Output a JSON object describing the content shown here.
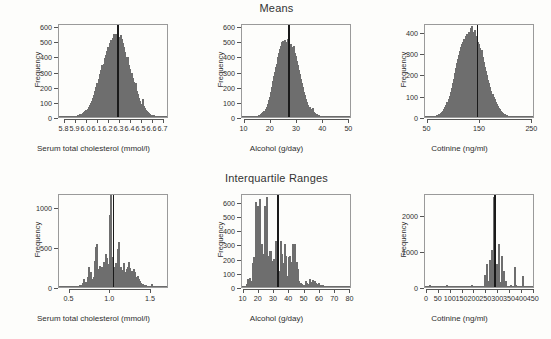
{
  "figure": {
    "background_color": "#fdfdfb",
    "bar_fill_color": "#b9b9b9",
    "bar_edge_color": "#6e6e6e",
    "reference_line_color": "#1a1a1a",
    "row_titles": [
      "Means",
      "Interquartile Ranges"
    ]
  },
  "chart_data": [
    {
      "id": "top-left",
      "type": "bar",
      "title": "",
      "xlabel": "Serum total cholesterol (mmol/l)",
      "ylabel": "Frequency",
      "xlim": [
        5.75,
        6.75
      ],
      "ylim": [
        0,
        620
      ],
      "xticks": [
        5.8,
        5.9,
        6.0,
        6.1,
        6.2,
        6.3,
        6.4,
        6.5,
        6.6,
        6.7
      ],
      "xticklabels": [
        "5.8",
        "5.9",
        "6.0",
        "6.1",
        "6.2",
        "6.3",
        "6.4",
        "6.5",
        "6.6",
        "6.7"
      ],
      "yticks": [
        0,
        100,
        200,
        300,
        400,
        500,
        600
      ],
      "yticklabels": [
        "0",
        "100",
        "200",
        "300",
        "400",
        "500",
        "600"
      ],
      "grid": false,
      "reference_line": 6.28,
      "bin_width": 0.01,
      "bin_starts": [
        5.82,
        5.83,
        5.84,
        5.85,
        5.86,
        5.87,
        5.88,
        5.89,
        5.9,
        5.91,
        5.92,
        5.93,
        5.94,
        5.95,
        5.96,
        5.97,
        5.98,
        5.99,
        6.0,
        6.01,
        6.02,
        6.03,
        6.04,
        6.05,
        6.06,
        6.07,
        6.08,
        6.09,
        6.1,
        6.11,
        6.12,
        6.13,
        6.14,
        6.15,
        6.16,
        6.17,
        6.18,
        6.19,
        6.2,
        6.21,
        6.22,
        6.23,
        6.24,
        6.25,
        6.26,
        6.27,
        6.28,
        6.29,
        6.3,
        6.31,
        6.32,
        6.33,
        6.34,
        6.35,
        6.36,
        6.37,
        6.38,
        6.39,
        6.4,
        6.41,
        6.42,
        6.43,
        6.44,
        6.45,
        6.46,
        6.47,
        6.48,
        6.49,
        6.5,
        6.51,
        6.52,
        6.53,
        6.54,
        6.55,
        6.56,
        6.57,
        6.58,
        6.59,
        6.6,
        6.61,
        6.62,
        6.63,
        6.64,
        6.65
      ],
      "values": [
        2,
        3,
        2,
        4,
        4,
        5,
        6,
        8,
        9,
        12,
        13,
        17,
        20,
        23,
        27,
        33,
        39,
        46,
        55,
        64,
        77,
        90,
        108,
        126,
        148,
        170,
        196,
        222,
        252,
        283,
        312,
        345,
        330,
        352,
        392,
        408,
        437,
        462,
        486,
        505,
        502,
        520,
        545,
        534,
        550,
        528,
        540,
        528,
        541,
        512,
        487,
        463,
        432,
        396,
        366,
        398,
        344,
        318,
        292,
        258,
        228,
        200,
        222,
        170,
        152,
        128,
        107,
        88,
        120,
        74,
        60,
        48,
        40,
        32,
        26,
        20,
        16,
        13,
        10,
        8,
        6,
        5,
        3,
        2
      ]
    },
    {
      "id": "top-middle",
      "type": "bar",
      "title": "Means",
      "xlabel": "Alcohol (g/day)",
      "ylabel": "Frequency",
      "xlim": [
        9,
        51
      ],
      "ylim": [
        0,
        620
      ],
      "xticks": [
        10,
        20,
        30,
        40,
        50
      ],
      "xticklabels": [
        "10",
        "20",
        "30",
        "40",
        "50"
      ],
      "yticks": [
        0,
        100,
        200,
        300,
        400,
        500,
        600
      ],
      "yticklabels": [
        "0",
        "100",
        "200",
        "300",
        "400",
        "500",
        "600"
      ],
      "grid": false,
      "reference_line": 26.6,
      "bin_width": 0.4,
      "bin_starts": [
        12.8,
        13.2,
        13.6,
        14.0,
        14.4,
        14.8,
        15.2,
        15.6,
        16.0,
        16.4,
        16.8,
        17.2,
        17.6,
        18.0,
        18.4,
        18.8,
        19.2,
        19.6,
        20.0,
        20.4,
        20.8,
        21.2,
        21.6,
        22.0,
        22.4,
        22.8,
        23.2,
        23.6,
        24.0,
        24.4,
        24.8,
        25.2,
        25.6,
        26.0,
        26.4,
        26.8,
        27.2,
        27.6,
        28.0,
        28.4,
        28.8,
        29.2,
        29.6,
        30.0,
        30.4,
        30.8,
        31.2,
        31.6,
        32.0,
        32.4,
        32.8,
        33.2,
        33.6,
        34.0,
        34.4,
        34.8,
        35.2,
        35.6,
        36.0,
        36.4,
        36.8,
        37.2,
        37.6,
        38.0,
        38.4,
        38.8,
        39.2,
        39.6,
        40.0,
        40.8,
        41.6,
        42.4,
        43.2,
        44.0,
        45.0
      ],
      "values": [
        2,
        3,
        3,
        5,
        6,
        8,
        10,
        14,
        18,
        24,
        30,
        40,
        52,
        68,
        86,
        110,
        135,
        165,
        200,
        240,
        268,
        300,
        330,
        352,
        398,
        420,
        450,
        470,
        492,
        500,
        486,
        505,
        498,
        512,
        600,
        470,
        480,
        462,
        440,
        468,
        420,
        400,
        370,
        345,
        310,
        282,
        252,
        222,
        196,
        168,
        142,
        120,
        100,
        82,
        68,
        54,
        44,
        58,
        34,
        28,
        22,
        18,
        14,
        11,
        8,
        6,
        5,
        4,
        3,
        2,
        2,
        1,
        1,
        1,
        1
      ]
    },
    {
      "id": "top-right",
      "type": "bar",
      "title": "",
      "xlabel": "Cotinine (ng/ml)",
      "ylabel": "Frequency",
      "xlim": [
        45,
        255
      ],
      "ylim": [
        0,
        440
      ],
      "xticks": [
        50,
        150,
        250
      ],
      "xticklabels": [
        "50",
        "150",
        "250"
      ],
      "yticks": [
        0,
        100,
        200,
        300,
        400
      ],
      "yticklabels": [
        "0",
        "100",
        "200",
        "300",
        "400"
      ],
      "grid": false,
      "reference_line": 144,
      "bin_width": 2,
      "bin_starts": [
        52,
        54,
        56,
        58,
        60,
        62,
        64,
        66,
        68,
        70,
        72,
        74,
        76,
        78,
        80,
        82,
        84,
        86,
        88,
        90,
        92,
        94,
        96,
        98,
        100,
        102,
        104,
        106,
        108,
        110,
        112,
        114,
        116,
        118,
        120,
        122,
        124,
        126,
        128,
        130,
        132,
        134,
        136,
        138,
        140,
        142,
        144,
        146,
        148,
        150,
        152,
        154,
        156,
        158,
        160,
        162,
        164,
        166,
        168,
        170,
        172,
        174,
        176,
        178,
        180,
        182,
        184,
        186,
        188,
        190,
        192,
        194,
        196,
        198,
        200,
        204,
        208,
        212,
        216,
        220,
        228,
        236,
        244
      ],
      "values": [
        2,
        2,
        3,
        3,
        4,
        5,
        6,
        8,
        10,
        13,
        16,
        20,
        25,
        30,
        38,
        46,
        56,
        68,
        82,
        98,
        116,
        136,
        158,
        180,
        205,
        228,
        252,
        272,
        292,
        310,
        326,
        340,
        352,
        366,
        344,
        380,
        390,
        362,
        400,
        415,
        424,
        400,
        390,
        408,
        380,
        365,
        352,
        340,
        322,
        300,
        312,
        280,
        258,
        236,
        214,
        196,
        174,
        158,
        140,
        124,
        108,
        94,
        82,
        70,
        60,
        50,
        42,
        36,
        30,
        24,
        20,
        16,
        13,
        10,
        8,
        6,
        5,
        4,
        3,
        2,
        2,
        1,
        1
      ]
    },
    {
      "id": "bottom-left",
      "type": "bar",
      "title": "",
      "xlabel": "Serum total cholesterol (mmol/l)",
      "ylabel": "Frequency",
      "xlim": [
        0.37,
        1.72
      ],
      "ylim": [
        0,
        1180
      ],
      "xticks": [
        0.5,
        1.0,
        1.5
      ],
      "xticklabels": [
        "0.5",
        "1.0",
        "1.5"
      ],
      "yticks": [
        0,
        500,
        1000
      ],
      "yticklabels": [
        "0",
        "500",
        "1000"
      ],
      "grid": false,
      "reference_line": 1.03,
      "bin_width": 0.012,
      "bin_starts": [
        0.42,
        0.46,
        0.5,
        0.54,
        0.58,
        0.61,
        0.63,
        0.65,
        0.67,
        0.69,
        0.71,
        0.73,
        0.75,
        0.77,
        0.785,
        0.8,
        0.815,
        0.83,
        0.845,
        0.86,
        0.875,
        0.89,
        0.905,
        0.92,
        0.935,
        0.95,
        0.965,
        0.98,
        0.995,
        1.01,
        1.025,
        1.04,
        1.055,
        1.07,
        1.085,
        1.1,
        1.115,
        1.13,
        1.145,
        1.16,
        1.175,
        1.19,
        1.205,
        1.22,
        1.235,
        1.25,
        1.265,
        1.28,
        1.295,
        1.31,
        1.325,
        1.34,
        1.355,
        1.37,
        1.385,
        1.4,
        1.42,
        1.44,
        1.47,
        1.5,
        1.54,
        1.58,
        1.62,
        1.66
      ],
      "values": [
        12,
        10,
        14,
        12,
        16,
        20,
        30,
        55,
        95,
        60,
        130,
        250,
        185,
        95,
        120,
        330,
        500,
        540,
        220,
        260,
        160,
        255,
        320,
        275,
        420,
        370,
        290,
        900,
        1150,
        380,
        365,
        250,
        300,
        230,
        480,
        565,
        250,
        210,
        160,
        300,
        185,
        230,
        250,
        310,
        240,
        200,
        160,
        230,
        190,
        120,
        140,
        95,
        70,
        50,
        40,
        30,
        22,
        18,
        14,
        40,
        12,
        10,
        8,
        6
      ]
    },
    {
      "id": "bottom-middle",
      "type": "bar",
      "title": "Interquartile Ranges",
      "xlabel": "Alcohol (g/day)",
      "ylabel": "Frequency",
      "xlim": [
        9,
        81
      ],
      "ylim": [
        0,
        660
      ],
      "xticks": [
        10,
        20,
        30,
        40,
        50,
        60,
        70,
        80
      ],
      "xticklabels": [
        "10",
        "20",
        "30",
        "40",
        "50",
        "60",
        "70",
        "80"
      ],
      "yticks": [
        0,
        100,
        200,
        300,
        400,
        500,
        600
      ],
      "yticklabels": [
        "0",
        "100",
        "200",
        "300",
        "400",
        "500",
        "600"
      ],
      "grid": false,
      "reference_line": 32.0,
      "bin_width": 0.7,
      "bin_starts": [
        11.5,
        12.2,
        12.9,
        13.6,
        14.3,
        15.0,
        15.7,
        16.4,
        17.1,
        17.8,
        18.5,
        19.2,
        19.9,
        20.6,
        21.3,
        22.0,
        22.7,
        23.4,
        24.1,
        24.8,
        25.5,
        26.2,
        26.9,
        27.6,
        28.3,
        29.0,
        29.7,
        30.4,
        31.1,
        31.8,
        32.5,
        33.2,
        33.9,
        34.6,
        35.3,
        36.0,
        36.7,
        37.4,
        38.1,
        38.8,
        39.5,
        40.2,
        40.9,
        41.6,
        42.3,
        43.0,
        43.7,
        44.4,
        45.1,
        45.8,
        46.5,
        47.2,
        47.9,
        48.6,
        49.3,
        50.0,
        51.0,
        52.0,
        53.0,
        54.0,
        55.0,
        56.0,
        57.0,
        58.0,
        59.0,
        60.0,
        61.5,
        63.0,
        65.0,
        67.0,
        69.0,
        71.0,
        73.0,
        75.0
      ],
      "values": [
        20,
        55,
        18,
        60,
        30,
        40,
        170,
        210,
        175,
        595,
        570,
        400,
        620,
        250,
        300,
        160,
        230,
        570,
        200,
        630,
        220,
        170,
        250,
        250,
        180,
        200,
        140,
        320,
        240,
        230,
        90,
        110,
        320,
        230,
        170,
        115,
        300,
        215,
        80,
        210,
        215,
        120,
        175,
        300,
        165,
        300,
        165,
        175,
        130,
        40,
        20,
        30,
        18,
        14,
        12,
        45,
        25,
        20,
        55,
        35,
        50,
        40,
        25,
        20,
        30,
        15,
        12,
        10,
        8,
        7,
        6,
        4,
        3,
        5
      ]
    },
    {
      "id": "bottom-right",
      "type": "bar",
      "title": "",
      "xlabel": "Cotinine (ng/ml)",
      "ylabel": "Frequency",
      "xlim": [
        -8,
        455
      ],
      "ylim": [
        0,
        2600
      ],
      "xticks": [
        0,
        50,
        100,
        150,
        200,
        250,
        300,
        350,
        400,
        450
      ],
      "xticklabels": [
        "0",
        "50",
        "100",
        "150",
        "200",
        "250",
        "300",
        "350",
        "400",
        "450"
      ],
      "yticks": [
        0,
        1000,
        2000
      ],
      "yticklabels": [
        "0",
        "1000",
        "2000"
      ],
      "grid": false,
      "reference_line": 283,
      "bin_width": 5,
      "bin_starts": [
        10,
        20,
        30,
        80,
        90,
        120,
        150,
        185,
        195,
        230,
        240,
        250,
        255,
        260,
        265,
        270,
        275,
        280,
        285,
        290,
        295,
        300,
        305,
        310,
        315,
        320,
        325,
        330,
        340,
        350,
        360,
        365,
        370,
        380,
        390,
        400,
        405,
        410,
        420,
        430
      ],
      "values": [
        55,
        40,
        20,
        45,
        30,
        15,
        20,
        60,
        35,
        30,
        320,
        630,
        180,
        760,
        200,
        1020,
        230,
        2500,
        110,
        640,
        80,
        1180,
        140,
        860,
        120,
        450,
        60,
        180,
        40,
        60,
        30,
        540,
        60,
        40,
        20,
        300,
        30,
        25,
        18,
        12
      ]
    }
  ]
}
